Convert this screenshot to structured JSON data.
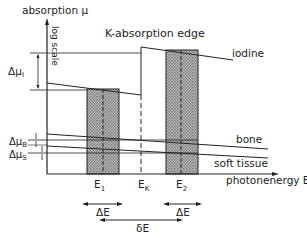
{
  "diagram": {
    "title": "K-absorption edge",
    "y_axis": {
      "label": "absorption μ",
      "scale_label": "log scale"
    },
    "x_axis": {
      "label": "photonenergy E"
    },
    "curves": {
      "iodine": "iodine",
      "bone": "bone",
      "soft_tissue": "soft tissue"
    },
    "deltas": {
      "mu_i": "Δμ",
      "mu_i_sub": "I",
      "mu_b": "Δμ",
      "mu_b_sub": "B",
      "mu_s": "Δμ",
      "mu_s_sub": "S"
    },
    "energies": {
      "e1": "E",
      "e1_sub": "1",
      "ek": "E",
      "ek_sub": "K",
      "e2": "E",
      "e2_sub": "2"
    },
    "bandwidths": {
      "delta_e_1": "ΔE",
      "delta_e_2": "ΔE",
      "small_delta_e": "δE"
    }
  }
}
